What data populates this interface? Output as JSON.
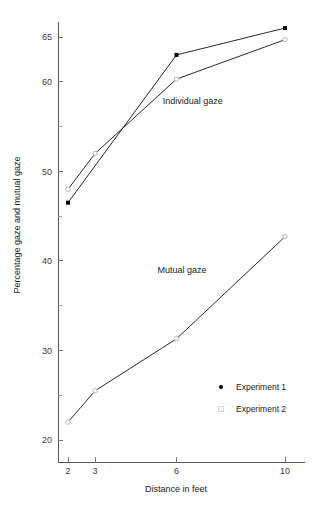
{
  "chart_data": {
    "type": "line",
    "title": "",
    "xlabel": "Distance in feet",
    "ylabel": "Percentage gaze and mutual gaze",
    "x": [
      2,
      3,
      6,
      10
    ],
    "xtick_labels": [
      "2",
      "3",
      "6",
      "10"
    ],
    "ytick_labels": [
      "20",
      "30",
      "40",
      "50",
      "60",
      "65"
    ],
    "ytick_values": [
      20,
      30,
      40,
      50,
      60,
      65
    ],
    "yminor_values": [
      25,
      35,
      45,
      55
    ],
    "ylim": [
      19,
      67.5
    ],
    "grid": false,
    "legend_position": "bottom-right",
    "series": [
      {
        "name": "Individual gaze — Experiment 1",
        "group": "Individual gaze",
        "experiment": "Experiment 1",
        "marker": "filled-dot",
        "x": [
          2,
          6,
          10
        ],
        "values": [
          46.5,
          63.0,
          66.0
        ]
      },
      {
        "name": "Individual gaze — Experiment 2",
        "group": "Individual gaze",
        "experiment": "Experiment 2",
        "marker": "open-circle",
        "x": [
          2,
          3,
          6,
          10
        ],
        "values": [
          48.0,
          52.0,
          60.3,
          64.7
        ]
      },
      {
        "name": "Mutual gaze — Experiment 2",
        "group": "Mutual gaze",
        "experiment": "Experiment 2",
        "marker": "open-circle",
        "x": [
          2,
          3,
          6,
          10
        ],
        "values": [
          22.0,
          25.5,
          31.3,
          42.7
        ]
      }
    ],
    "annotations": [
      {
        "text": "Individual gaze",
        "x": 6.6,
        "y": 57.5
      },
      {
        "text": "Mutual gaze",
        "x": 6.2,
        "y": 38.6
      }
    ],
    "legend": [
      {
        "label": "Experiment 1",
        "marker": "filled-dot"
      },
      {
        "label": "Experiment 2",
        "marker": "open-circle"
      }
    ]
  },
  "axes": {
    "x_title": "Distance in feet",
    "y_title": "Percentage gaze and mutual gaze"
  },
  "ticks": {
    "x": [
      "2",
      "3",
      "6",
      "10"
    ],
    "y": [
      "65",
      "60",
      "50",
      "40",
      "30",
      "20"
    ]
  },
  "annotations": {
    "individual_gaze": "Individual gaze",
    "mutual_gaze": "Mutual gaze"
  },
  "legend": {
    "experiment_1": "Experiment 1",
    "experiment_2": "Experiment 2"
  },
  "colors": {
    "line": "#111111",
    "marker_filled": "#000000",
    "marker_open_stroke": "#b0b0b0",
    "axis": "#555555",
    "text": "#1a1a1a",
    "background": "#ffffff"
  }
}
